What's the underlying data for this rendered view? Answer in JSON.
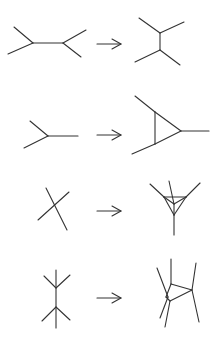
{
  "figure": {
    "stroke_color": "#333333",
    "background": "#ffffff",
    "rows": [
      {
        "name": "row-1",
        "left": {
          "label": "two trivalent vertices joined by horizontal edge",
          "lines": [
            [
              14,
              27,
              33,
              43
            ],
            [
              8,
              54,
              33,
              43
            ],
            [
              33,
              43,
              63,
              43
            ],
            [
              63,
              43,
              86,
              30
            ],
            [
              63,
              43,
              81,
              57
            ]
          ]
        },
        "arrow": {
          "x1": 97,
          "y1": 44,
          "x2": 121,
          "y2": 44
        },
        "right": {
          "label": "two trivalent vertices joined by vertical edge",
          "lines": [
            [
              139,
              18,
              160,
              33
            ],
            [
              184,
              22,
              160,
              33
            ],
            [
              160,
              33,
              160,
              50
            ],
            [
              135,
              62,
              160,
              50
            ],
            [
              180,
              65,
              160,
              50
            ]
          ]
        }
      },
      {
        "name": "row-2",
        "left": {
          "label": "single trivalent vertex",
          "lines": [
            [
              30,
              121,
              48,
              136
            ],
            [
              24,
              148,
              48,
              136
            ],
            [
              48,
              136,
              78,
              136
            ]
          ]
        },
        "arrow": {
          "x1": 97,
          "y1": 135,
          "x2": 121,
          "y2": 135
        },
        "right": {
          "label": "vertex replaced by triangle",
          "lines": [
            [
              135,
              96,
              155,
              112
            ],
            [
              155,
              112,
              155,
              144
            ],
            [
              155,
              112,
              181,
              131
            ],
            [
              155,
              144,
              181,
              131
            ],
            [
              155,
              144,
              132,
              154
            ],
            [
              181,
              131,
              209,
              131
            ]
          ]
        }
      },
      {
        "name": "row-3",
        "left": {
          "label": "four-valent crossing vertex",
          "lines": [
            [
              46,
              188,
              67,
              230
            ],
            [
              69,
              192,
              38,
              220
            ]
          ]
        },
        "arrow": {
          "x1": 97,
          "y1": 211,
          "x2": 121,
          "y2": 211
        },
        "right": {
          "label": "vertex replaced by tetrahedron",
          "lines": [
            [
              150,
              184,
              164,
              197
            ],
            [
              200,
              183,
              186,
              197
            ],
            [
              164,
              197,
              186,
              197
            ],
            [
              164,
              197,
              174,
              215
            ],
            [
              186,
              197,
              174,
              215
            ],
            [
              164,
              197,
              174,
              204
            ],
            [
              186,
              197,
              174,
              204
            ],
            [
              174,
              215,
              174,
              204
            ],
            [
              169,
              181,
              174,
              204
            ],
            [
              174,
              215,
              174,
              235
            ]
          ]
        }
      },
      {
        "name": "row-4",
        "left": {
          "label": "two four-valent vertices on vertical edge",
          "lines": [
            [
              56,
              270,
              56,
              328
            ],
            [
              44,
              276,
              56,
              288
            ],
            [
              70,
              275,
              56,
              288
            ],
            [
              42,
              321,
              56,
              307
            ],
            [
              70,
              320,
              56,
              307
            ]
          ]
        },
        "arrow": {
          "x1": 97,
          "y1": 298,
          "x2": 121,
          "y2": 298
        },
        "right": {
          "label": "resolved into triangle configuration",
          "lines": [
            [
              171,
              259,
              171,
              284
            ],
            [
              171,
              284,
              192,
              290
            ],
            [
              192,
              290,
              170,
              301
            ],
            [
              171,
              284,
              166,
              297
            ],
            [
              196,
              263,
              192,
              290
            ],
            [
              192,
              290,
              199,
              322
            ],
            [
              157,
              268,
              168,
              297
            ],
            [
              168,
              297,
              160,
              318
            ],
            [
              170,
              301,
              165,
              327
            ],
            [
              170,
              301,
              166,
              297
            ]
          ]
        }
      }
    ]
  }
}
